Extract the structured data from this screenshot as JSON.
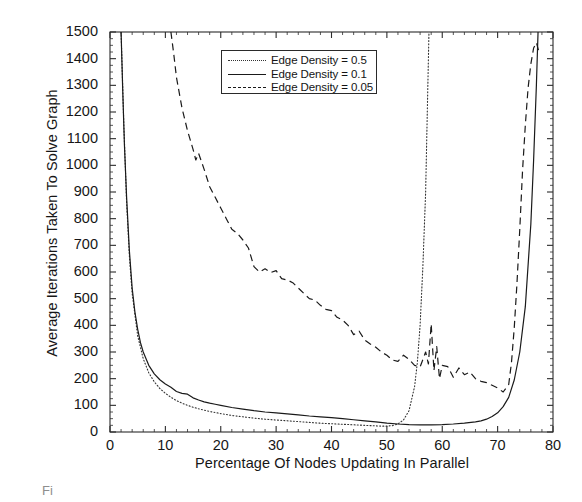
{
  "chart_data": {
    "type": "line",
    "title": "",
    "xlabel": "Percentage Of Nodes Updating In Parallel",
    "ylabel": "Average Iterations Taken To Solve Graph",
    "xlim": [
      0,
      80
    ],
    "ylim": [
      0,
      1500
    ],
    "xticks": [
      0,
      10,
      20,
      30,
      40,
      50,
      60,
      70,
      80
    ],
    "yticks": [
      0,
      100,
      200,
      300,
      400,
      500,
      600,
      700,
      800,
      900,
      1000,
      1100,
      1200,
      1300,
      1400,
      1500
    ],
    "xtick_labels": [
      "0",
      "10",
      "20",
      "30",
      "40",
      "50",
      "60",
      "70",
      "80"
    ],
    "ytick_labels": [
      "0",
      "100",
      "200",
      "300",
      "400",
      "500",
      "600",
      "700",
      "800",
      "900",
      "1000",
      "1100",
      "1200",
      "1300",
      "1400",
      "1500"
    ],
    "grid": false,
    "minor_ticks": true,
    "legend_position": "upper center",
    "series": [
      {
        "name": "Edge Density = 0.5",
        "style": "dotted",
        "color": "#333333",
        "x": [
          2.0,
          2.5,
          3.0,
          3.5,
          4.0,
          5.0,
          6.0,
          7.0,
          8.0,
          9.0,
          10.0,
          11.0,
          12.0,
          13.0,
          14.0,
          15.0,
          16.0,
          18.0,
          20.0,
          22.0,
          24.0,
          26.0,
          28.0,
          30.0,
          32.0,
          34.0,
          36.0,
          38.0,
          40.0,
          42.0,
          44.0,
          46.0,
          47.0,
          48.0,
          49.0,
          50.0,
          51.0,
          52.0,
          53.0,
          54.0,
          55.0,
          55.5,
          56.0,
          56.5,
          57.0,
          57.3,
          57.6
        ],
        "y": [
          1500,
          1150,
          860,
          660,
          520,
          360,
          275,
          222,
          188,
          163,
          145,
          130,
          118,
          108,
          100,
          93,
          87,
          77,
          69,
          62,
          57,
          52,
          48,
          45,
          42,
          39,
          36,
          33,
          31,
          29,
          27,
          25,
          24,
          23,
          22,
          22,
          24,
          30,
          45,
          80,
          170,
          260,
          400,
          620,
          900,
          1200,
          1500
        ]
      },
      {
        "name": "Edge Density = 0.1",
        "style": "solid",
        "color": "#1a1a1a",
        "x": [
          2.0,
          2.3,
          2.6,
          3.0,
          3.5,
          4.0,
          4.5,
          5.0,
          5.5,
          6.0,
          7.0,
          8.0,
          9.0,
          10.0,
          11.0,
          12.0,
          13.0,
          14.0,
          15.0,
          16.0,
          17.0,
          18.0,
          19.0,
          20.0,
          22.0,
          24.0,
          26.0,
          28.0,
          30.0,
          32.0,
          34.0,
          36.0,
          38.0,
          40.0,
          42.0,
          44.0,
          46.0,
          48.0,
          50.0,
          52.0,
          54.0,
          56.0,
          58.0,
          60.0,
          62.0,
          64.0,
          66.0,
          67.0,
          68.0,
          69.0,
          70.0,
          71.0,
          72.0,
          73.0,
          74.0,
          75.0,
          76.0,
          76.5,
          77.0,
          77.3
        ],
        "y": [
          1500,
          1280,
          1080,
          880,
          680,
          540,
          450,
          385,
          335,
          300,
          250,
          218,
          196,
          180,
          168,
          152,
          145,
          142,
          128,
          120,
          113,
          108,
          104,
          100,
          92,
          86,
          80,
          75,
          72,
          68,
          64,
          60,
          57,
          54,
          50,
          46,
          42,
          38,
          33,
          30,
          28,
          27,
          27,
          28,
          30,
          33,
          38,
          42,
          48,
          58,
          72,
          95,
          130,
          195,
          300,
          470,
          780,
          1020,
          1300,
          1500
        ]
      },
      {
        "name": "Edge Density = 0.05",
        "style": "dashed",
        "color": "#1a1a1a",
        "x": [
          11.0,
          11.5,
          12.0,
          13.0,
          14.0,
          15.0,
          15.5,
          16.0,
          17.0,
          18.0,
          19.0,
          20.0,
          21.0,
          22.0,
          23.0,
          24.0,
          25.0,
          26.0,
          27.0,
          28.0,
          29.0,
          30.0,
          31.0,
          32.0,
          33.0,
          34.0,
          35.0,
          36.0,
          37.0,
          38.0,
          39.0,
          40.0,
          41.0,
          42.0,
          43.0,
          44.0,
          45.0,
          46.0,
          47.0,
          48.0,
          49.0,
          50.0,
          51.0,
          52.0,
          53.0,
          54.0,
          55.0,
          56.0,
          57.0,
          57.5,
          58.0,
          58.5,
          59.0,
          59.5,
          60.0,
          61.0,
          62.0,
          63.0,
          64.0,
          65.0,
          66.0,
          67.0,
          68.0,
          69.0,
          70.0,
          71.0,
          72.0,
          72.5,
          73.0,
          73.5,
          74.0,
          74.5,
          75.0,
          75.5,
          76.0,
          76.5,
          77.0,
          77.4
        ],
        "y": [
          1500,
          1420,
          1330,
          1215,
          1130,
          1060,
          1020,
          1045,
          985,
          920,
          880,
          840,
          800,
          760,
          745,
          720,
          690,
          620,
          600,
          612,
          598,
          605,
          575,
          570,
          560,
          540,
          520,
          500,
          495,
          475,
          460,
          455,
          430,
          420,
          400,
          365,
          378,
          345,
          330,
          318,
          300,
          288,
          270,
          265,
          288,
          272,
          250,
          244,
          300,
          255,
          405,
          230,
          320,
          200,
          250,
          245,
          205,
          240,
          215,
          225,
          200,
          190,
          185,
          175,
          165,
          150,
          178,
          260,
          390,
          560,
          760,
          980,
          1150,
          1290,
          1380,
          1440,
          1460,
          1430
        ]
      }
    ]
  },
  "axis": {
    "x_label": "Percentage Of Nodes Updating In Parallel",
    "y_label": "Average Iterations Taken To Solve Graph"
  },
  "legend": {
    "entries": [
      {
        "label": "Edge Density = 0.5",
        "style": "dotted"
      },
      {
        "label": "Edge Density = 0.1",
        "style": "solid"
      },
      {
        "label": "Edge Density = 0.05",
        "style": "dashed"
      }
    ]
  },
  "caption": {
    "text": "Fi"
  }
}
